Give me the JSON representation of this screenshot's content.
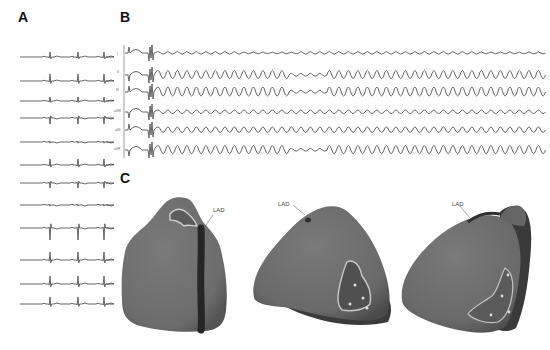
{
  "figure": {
    "panels": [
      {
        "id": "A",
        "label": "A",
        "description": "12-lead baseline ECG in sinus rhythm",
        "trace_count": 12
      },
      {
        "id": "B",
        "label": "B",
        "description": "Limb-lead ECG showing onset of ventricular tachycardia",
        "leads": [
          "I",
          "II",
          "III",
          "aVR",
          "aVL",
          "aVF"
        ]
      },
      {
        "id": "C",
        "label": "C",
        "description": "3D electroanatomic heart reconstructions with scar regions",
        "views": [
          {
            "name": "anterior-view",
            "annotation": "LAD"
          },
          {
            "name": "inferior-view",
            "annotation": "LAD"
          },
          {
            "name": "lateral-view",
            "annotation": "LAD"
          }
        ]
      }
    ]
  },
  "colors": {
    "trace": "#555555",
    "heart_surface": "#707070",
    "heart_shadow": "#3a3a3a",
    "lad_vessel": "#2a2a2a",
    "scar_border": "#c8c8c8",
    "scar_core": "#505050"
  }
}
